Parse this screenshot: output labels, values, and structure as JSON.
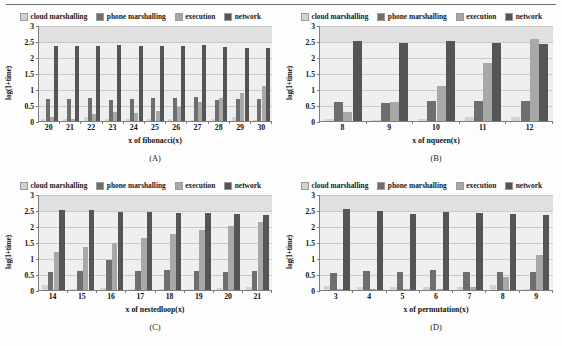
{
  "figure": {
    "series_names": [
      "cloud marshalling",
      "phone marshalling",
      "execution",
      "network"
    ],
    "colors": {
      "cloud_marshalling": "#d2d2d2",
      "phone_marshalling": "#6e6e6e",
      "execution": "#a8a8a8",
      "network": "#555555",
      "plot_background": "#efefef",
      "band": "#e0e0e0",
      "gridline": "#c9c9c9",
      "axis": "#7d7d7d",
      "text": "#111111"
    },
    "y_axis": {
      "label": "log(1+time)",
      "ticks": [
        "0",
        "0.5",
        "1",
        "1.5",
        "2",
        "2.5",
        "3"
      ],
      "min": 0,
      "max": 3
    }
  },
  "chart_data": [
    {
      "type": "bar",
      "panel": "A",
      "caption": "(A)",
      "title": "",
      "xlabel": "x of fibonacci(x)",
      "ylabel": "log(1+time)",
      "ylim": [
        0,
        3
      ],
      "grid": true,
      "legend_position": "top",
      "categories": [
        "20",
        "21",
        "22",
        "23",
        "24",
        "25",
        "26",
        "27",
        "28",
        "29",
        "30"
      ],
      "series": [
        {
          "name": "cloud marshalling",
          "values": [
            0.06,
            0.05,
            0.11,
            0.05,
            0.06,
            0.07,
            0.05,
            0.04,
            0.05,
            0.13,
            0.04
          ]
        },
        {
          "name": "phone marshalling",
          "values": [
            0.7,
            0.68,
            0.71,
            0.67,
            0.68,
            0.72,
            0.73,
            0.75,
            0.67,
            0.7,
            0.7
          ]
        },
        {
          "name": "execution",
          "values": [
            0.14,
            0.07,
            0.21,
            0.27,
            0.25,
            0.3,
            0.45,
            0.6,
            0.72,
            0.88,
            1.08
          ]
        },
        {
          "name": "network",
          "values": [
            2.34,
            2.33,
            2.33,
            2.38,
            2.33,
            2.33,
            2.34,
            2.37,
            2.3,
            2.29,
            2.27
          ]
        }
      ]
    },
    {
      "type": "bar",
      "panel": "B",
      "caption": "(B)",
      "title": "",
      "xlabel": "x of nqueen(x)",
      "ylabel": "log(1+time)",
      "ylim": [
        0,
        3
      ],
      "grid": true,
      "legend_position": "top",
      "categories": [
        "8",
        "9",
        "10",
        "11",
        "12"
      ],
      "series": [
        {
          "name": "cloud marshalling",
          "values": [
            0.06,
            0.03,
            0.05,
            0.11,
            0.13
          ]
        },
        {
          "name": "phone marshalling",
          "values": [
            0.59,
            0.57,
            0.62,
            0.63,
            0.61
          ]
        },
        {
          "name": "execution",
          "values": [
            0.29,
            0.58,
            1.1,
            1.8,
            2.55
          ]
        },
        {
          "name": "network",
          "values": [
            2.51,
            2.45,
            2.49,
            2.45,
            2.41
          ]
        }
      ]
    },
    {
      "type": "bar",
      "panel": "C",
      "caption": "(C)",
      "title": "",
      "xlabel": "x of nestedloop(x)",
      "ylabel": "log(1+time)",
      "ylim": [
        0,
        3
      ],
      "grid": true,
      "legend_position": "top",
      "categories": [
        "14",
        "15",
        "16",
        "17",
        "18",
        "19",
        "20",
        "21"
      ],
      "series": [
        {
          "name": "cloud marshalling",
          "values": [
            0.15,
            0.04,
            0.06,
            0.03,
            0.03,
            0.04,
            0.05,
            0.09
          ]
        },
        {
          "name": "phone marshalling",
          "values": [
            0.57,
            0.6,
            0.94,
            0.59,
            0.62,
            0.6,
            0.56,
            0.59
          ]
        },
        {
          "name": "execution",
          "values": [
            1.2,
            1.35,
            1.47,
            1.61,
            1.75,
            1.89,
            2.0,
            2.11
          ]
        },
        {
          "name": "network",
          "values": [
            2.5,
            2.5,
            2.45,
            2.45,
            2.42,
            2.4,
            2.37,
            2.35
          ]
        }
      ]
    },
    {
      "type": "bar",
      "panel": "D",
      "caption": "(D)",
      "title": "",
      "xlabel": "x of permutation(x)",
      "ylabel": "log(1+time)",
      "ylim": [
        0,
        3
      ],
      "grid": true,
      "legend_position": "top",
      "categories": [
        "3",
        "4",
        "5",
        "6",
        "7",
        "8",
        "9"
      ],
      "series": [
        {
          "name": "cloud marshalling",
          "values": [
            0.14,
            0.09,
            0.09,
            0.08,
            0.08,
            0.17,
            0.04
          ]
        },
        {
          "name": "phone marshalling",
          "values": [
            0.53,
            0.6,
            0.57,
            0.61,
            0.55,
            0.55,
            0.57
          ]
        },
        {
          "name": "execution",
          "values": [
            0.02,
            0.02,
            0.02,
            0.02,
            0.09,
            0.42,
            1.1
          ]
        },
        {
          "name": "network",
          "values": [
            2.52,
            2.47,
            2.39,
            2.44,
            2.41,
            2.36,
            2.33
          ]
        }
      ]
    }
  ]
}
